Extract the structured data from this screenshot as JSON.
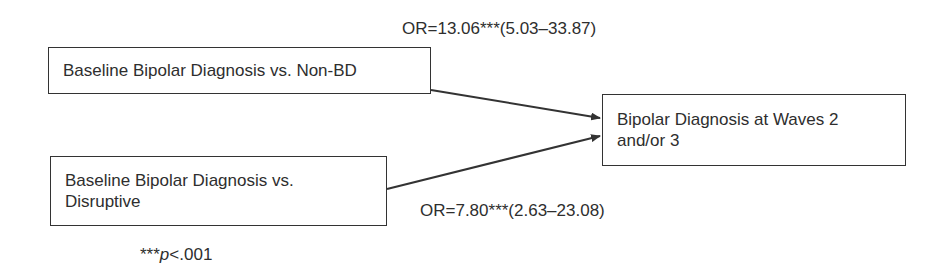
{
  "diagram": {
    "type": "path-diagram",
    "nodes": [
      {
        "id": "predictor_nonbd",
        "label": "Baseline Bipolar Diagnosis vs. Non-BD"
      },
      {
        "id": "predictor_disruptive",
        "label_line1": "Baseline Bipolar Diagnosis vs.",
        "label_line2": "Disruptive"
      },
      {
        "id": "outcome",
        "label_line1": "Bipolar Diagnosis at Waves 2",
        "label_line2": "and/or 3"
      }
    ],
    "edges": [
      {
        "from": "predictor_nonbd",
        "to": "outcome",
        "label": "OR=13.06***(5.03–33.87)"
      },
      {
        "from": "predictor_disruptive",
        "to": "outcome",
        "label": "OR=7.80***(2.63–23.08)"
      }
    ],
    "footnote": {
      "stars": "***",
      "p_symbol": "p",
      "rest": "<.001"
    },
    "colors": {
      "line": "#333333",
      "text": "#2e2e2e",
      "background": "#ffffff"
    }
  }
}
